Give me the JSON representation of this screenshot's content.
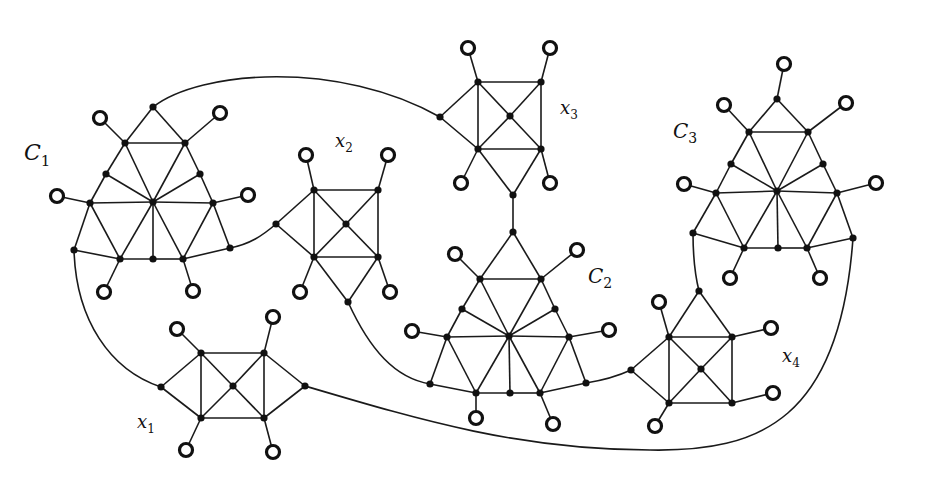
{
  "figure": {
    "colors": {
      "stroke": "#1a1a1a",
      "node": "#111111",
      "ring_fill": "#ffffff",
      "background": "#ffffff"
    }
  },
  "labels": [
    {
      "id": "C1",
      "main": "C",
      "sub": "1",
      "x": 24,
      "y": 160,
      "size": 22
    },
    {
      "id": "C2",
      "main": "C",
      "sub": "2",
      "x": 588,
      "y": 283,
      "size": 20
    },
    {
      "id": "C3",
      "main": "C",
      "sub": "3",
      "x": 673,
      "y": 138,
      "size": 20
    },
    {
      "id": "x1",
      "main": "x",
      "sub": "1",
      "x": 137,
      "y": 428,
      "size": 18
    },
    {
      "id": "x2",
      "main": "x",
      "sub": "2",
      "x": 335,
      "y": 147,
      "size": 18
    },
    {
      "id": "x3",
      "main": "x",
      "sub": "3",
      "x": 560,
      "y": 114,
      "size": 18
    },
    {
      "id": "x4",
      "main": "x",
      "sub": "4",
      "x": 782,
      "y": 362,
      "size": 18
    }
  ],
  "nodes": {
    "c1_top": [
      153,
      107
    ],
    "c1_ul": [
      125,
      143
    ],
    "c1_ur": [
      185,
      143
    ],
    "c1_ml": [
      106,
      174
    ],
    "c1_mr": [
      200,
      174
    ],
    "c1_l": [
      90,
      203
    ],
    "c1_c": [
      153,
      202
    ],
    "c1_r": [
      213,
      203
    ],
    "c1_bl": [
      74,
      250
    ],
    "c1_b1": [
      120,
      259
    ],
    "c1_b2": [
      153,
      259
    ],
    "c1_b3": [
      183,
      259
    ],
    "c1_br": [
      230,
      248
    ],
    "x2_tl": [
      314,
      190
    ],
    "x2_tr": [
      378,
      190
    ],
    "x2_c": [
      346,
      224
    ],
    "x2_bl": [
      314,
      257
    ],
    "x2_br": [
      378,
      257
    ],
    "x2_l": [
      276,
      224
    ],
    "x2_b": [
      348,
      302
    ],
    "x3_tl": [
      478,
      82
    ],
    "x3_tr": [
      541,
      82
    ],
    "x3_c": [
      510,
      116
    ],
    "x3_bl": [
      478,
      149
    ],
    "x3_br": [
      541,
      149
    ],
    "x3_l": [
      440,
      117
    ],
    "x3_b": [
      513,
      195
    ],
    "c2_top": [
      513,
      232
    ],
    "c2_ul": [
      480,
      279
    ],
    "c2_ur": [
      541,
      279
    ],
    "c2_ml": [
      462,
      309
    ],
    "c2_mr": [
      555,
      309
    ],
    "c2_l": [
      447,
      337
    ],
    "c2_c": [
      509,
      336
    ],
    "c2_r": [
      569,
      337
    ],
    "c2_bl": [
      430,
      384
    ],
    "c2_b1": [
      476,
      393
    ],
    "c2_b2": [
      510,
      393
    ],
    "c2_b3": [
      540,
      393
    ],
    "c2_br": [
      586,
      383
    ],
    "c3_top": [
      777,
      99
    ],
    "c3_ul": [
      749,
      132
    ],
    "c3_ur": [
      808,
      132
    ],
    "c3_ml": [
      731,
      164
    ],
    "c3_mr": [
      823,
      164
    ],
    "c3_l": [
      716,
      193
    ],
    "c3_c": [
      777,
      191
    ],
    "c3_r": [
      837,
      193
    ],
    "c3_bl": [
      693,
      233
    ],
    "c3_b1": [
      744,
      248
    ],
    "c3_b2": [
      778,
      248
    ],
    "c3_b3": [
      807,
      248
    ],
    "c3_br": [
      853,
      238
    ],
    "x4_t": [
      699,
      291
    ],
    "x4_tl": [
      669,
      337
    ],
    "x4_tr": [
      732,
      337
    ],
    "x4_c": [
      701,
      369
    ],
    "x4_bl": [
      669,
      403
    ],
    "x4_br": [
      732,
      403
    ],
    "x4_l": [
      631,
      370
    ],
    "x1_tl": [
      201,
      353
    ],
    "x1_tr": [
      264,
      353
    ],
    "x1_c": [
      233,
      386
    ],
    "x1_bl": [
      201,
      418
    ],
    "x1_br": [
      264,
      418
    ],
    "x1_l": [
      161,
      387
    ],
    "x1_r": [
      305,
      386
    ]
  },
  "rings": [
    {
      "at": [
        100,
        118
      ],
      "to": "c1_ul"
    },
    {
      "at": [
        220,
        113
      ],
      "to": "c1_ur"
    },
    {
      "at": [
        57,
        196
      ],
      "to": "c1_l"
    },
    {
      "at": [
        248,
        195
      ],
      "to": "c1_r"
    },
    {
      "at": [
        104,
        292
      ],
      "to": "c1_b1"
    },
    {
      "at": [
        193,
        291
      ],
      "to": "c1_b3"
    },
    {
      "at": [
        306,
        155
      ],
      "to": "x2_tl"
    },
    {
      "at": [
        388,
        155
      ],
      "to": "x2_tr"
    },
    {
      "at": [
        300,
        292
      ],
      "to": "x2_bl"
    },
    {
      "at": [
        390,
        292
      ],
      "to": "x2_br"
    },
    {
      "at": [
        468,
        48
      ],
      "to": "x3_tl"
    },
    {
      "at": [
        550,
        48
      ],
      "to": "x3_tr"
    },
    {
      "at": [
        461,
        183
      ],
      "to": "x3_bl"
    },
    {
      "at": [
        550,
        183
      ],
      "to": "x3_br"
    },
    {
      "at": [
        455,
        254
      ],
      "to": "c2_ul"
    },
    {
      "at": [
        577,
        250
      ],
      "to": "c2_ur"
    },
    {
      "at": [
        412,
        331
      ],
      "to": "c2_l"
    },
    {
      "at": [
        609,
        330
      ],
      "to": "c2_r"
    },
    {
      "at": [
        476,
        418
      ],
      "to": "c2_b1"
    },
    {
      "at": [
        553,
        424
      ],
      "to": "c2_b3"
    },
    {
      "at": [
        784,
        64
      ],
      "to": "c3_top"
    },
    {
      "at": [
        724,
        105
      ],
      "to": "c3_ul"
    },
    {
      "at": [
        846,
        103
      ],
      "to": "c3_ur"
    },
    {
      "at": [
        684,
        184
      ],
      "to": "c3_l"
    },
    {
      "at": [
        876,
        183
      ],
      "to": "c3_r"
    },
    {
      "at": [
        730,
        278
      ],
      "to": "c3_b1"
    },
    {
      "at": [
        820,
        278
      ],
      "to": "c3_b3"
    },
    {
      "at": [
        659,
        302
      ],
      "to": "x4_tl"
    },
    {
      "at": [
        771,
        328
      ],
      "to": "x4_tr"
    },
    {
      "at": [
        773,
        393
      ],
      "to": "x4_br"
    },
    {
      "at": [
        655,
        426
      ],
      "to": "x4_bl"
    },
    {
      "at": [
        177,
        329
      ],
      "to": "x1_tl"
    },
    {
      "at": [
        273,
        317
      ],
      "to": "x1_tr"
    },
    {
      "at": [
        186,
        450
      ],
      "to": "x1_bl"
    },
    {
      "at": [
        273,
        452
      ],
      "to": "x1_br"
    }
  ],
  "edges": [
    [
      "c1_top",
      "c1_ul"
    ],
    [
      "c1_top",
      "c1_ur"
    ],
    [
      "c1_ul",
      "c1_ur"
    ],
    [
      "c1_ul",
      "c1_ml"
    ],
    [
      "c1_ml",
      "c1_l"
    ],
    [
      "c1_ur",
      "c1_mr"
    ],
    [
      "c1_mr",
      "c1_r"
    ],
    [
      "c1_ul",
      "c1_c"
    ],
    [
      "c1_ur",
      "c1_c"
    ],
    [
      "c1_ml",
      "c1_c"
    ],
    [
      "c1_mr",
      "c1_c"
    ],
    [
      "c1_l",
      "c1_c"
    ],
    [
      "c1_c",
      "c1_r"
    ],
    [
      "c1_l",
      "c1_bl"
    ],
    [
      "c1_l",
      "c1_b1"
    ],
    [
      "c1_c",
      "c1_b1"
    ],
    [
      "c1_c",
      "c1_b2"
    ],
    [
      "c1_c",
      "c1_b3"
    ],
    [
      "c1_r",
      "c1_b3"
    ],
    [
      "c1_r",
      "c1_br"
    ],
    [
      "c1_bl",
      "c1_b1"
    ],
    [
      "c1_b1",
      "c1_b2"
    ],
    [
      "c1_b2",
      "c1_b3"
    ],
    [
      "c1_b3",
      "c1_br"
    ],
    [
      "x2_tl",
      "x2_tr"
    ],
    [
      "x2_bl",
      "x2_br"
    ],
    [
      "x2_tl",
      "x2_bl"
    ],
    [
      "x2_tr",
      "x2_br"
    ],
    [
      "x2_tl",
      "x2_c"
    ],
    [
      "x2_tr",
      "x2_c"
    ],
    [
      "x2_bl",
      "x2_c"
    ],
    [
      "x2_br",
      "x2_c"
    ],
    [
      "x2_l",
      "x2_tl"
    ],
    [
      "x2_l",
      "x2_bl"
    ],
    [
      "x2_bl",
      "x2_b"
    ],
    [
      "x2_br",
      "x2_b"
    ],
    [
      "x3_tl",
      "x3_tr"
    ],
    [
      "x3_bl",
      "x3_br"
    ],
    [
      "x3_tl",
      "x3_bl"
    ],
    [
      "x3_tr",
      "x3_br"
    ],
    [
      "x3_tl",
      "x3_c"
    ],
    [
      "x3_tr",
      "x3_c"
    ],
    [
      "x3_bl",
      "x3_c"
    ],
    [
      "x3_br",
      "x3_c"
    ],
    [
      "x3_l",
      "x3_tl"
    ],
    [
      "x3_l",
      "x3_bl"
    ],
    [
      "x3_bl",
      "x3_b"
    ],
    [
      "x3_br",
      "x3_b"
    ],
    [
      "x3_b",
      "c2_top"
    ],
    [
      "c2_top",
      "c2_ul"
    ],
    [
      "c2_top",
      "c2_ur"
    ],
    [
      "c2_ul",
      "c2_ur"
    ],
    [
      "c2_ul",
      "c2_ml"
    ],
    [
      "c2_ml",
      "c2_l"
    ],
    [
      "c2_ur",
      "c2_mr"
    ],
    [
      "c2_mr",
      "c2_r"
    ],
    [
      "c2_ul",
      "c2_c"
    ],
    [
      "c2_ur",
      "c2_c"
    ],
    [
      "c2_ml",
      "c2_c"
    ],
    [
      "c2_mr",
      "c2_c"
    ],
    [
      "c2_l",
      "c2_c"
    ],
    [
      "c2_c",
      "c2_r"
    ],
    [
      "c2_l",
      "c2_bl"
    ],
    [
      "c2_l",
      "c2_b1"
    ],
    [
      "c2_c",
      "c2_b1"
    ],
    [
      "c2_c",
      "c2_b2"
    ],
    [
      "c2_c",
      "c2_b3"
    ],
    [
      "c2_r",
      "c2_b3"
    ],
    [
      "c2_r",
      "c2_br"
    ],
    [
      "c2_bl",
      "c2_b1"
    ],
    [
      "c2_b1",
      "c2_b2"
    ],
    [
      "c2_b2",
      "c2_b3"
    ],
    [
      "c2_b3",
      "c2_br"
    ],
    [
      "c3_top",
      "c3_ul"
    ],
    [
      "c3_top",
      "c3_ur"
    ],
    [
      "c3_ul",
      "c3_ur"
    ],
    [
      "c3_ul",
      "c3_ml"
    ],
    [
      "c3_ml",
      "c3_l"
    ],
    [
      "c3_ur",
      "c3_mr"
    ],
    [
      "c3_mr",
      "c3_r"
    ],
    [
      "c3_ul",
      "c3_c"
    ],
    [
      "c3_ur",
      "c3_c"
    ],
    [
      "c3_ml",
      "c3_c"
    ],
    [
      "c3_mr",
      "c3_c"
    ],
    [
      "c3_l",
      "c3_c"
    ],
    [
      "c3_c",
      "c3_r"
    ],
    [
      "c3_l",
      "c3_bl"
    ],
    [
      "c3_l",
      "c3_b1"
    ],
    [
      "c3_c",
      "c3_b1"
    ],
    [
      "c3_c",
      "c3_b2"
    ],
    [
      "c3_c",
      "c3_b3"
    ],
    [
      "c3_r",
      "c3_b3"
    ],
    [
      "c3_r",
      "c3_br"
    ],
    [
      "c3_bl",
      "c3_b1"
    ],
    [
      "c3_b1",
      "c3_b2"
    ],
    [
      "c3_b2",
      "c3_b3"
    ],
    [
      "c3_b3",
      "c3_br"
    ],
    [
      "x4_tl",
      "x4_tr"
    ],
    [
      "x4_bl",
      "x4_br"
    ],
    [
      "x4_tl",
      "x4_bl"
    ],
    [
      "x4_tr",
      "x4_br"
    ],
    [
      "x4_tl",
      "x4_c"
    ],
    [
      "x4_tr",
      "x4_c"
    ],
    [
      "x4_bl",
      "x4_c"
    ],
    [
      "x4_br",
      "x4_c"
    ],
    [
      "x4_l",
      "x4_tl"
    ],
    [
      "x4_l",
      "x4_bl"
    ],
    [
      "x4_t",
      "x4_tl"
    ],
    [
      "x4_t",
      "x4_tr"
    ],
    [
      "x1_tl",
      "x1_tr"
    ],
    [
      "x1_bl",
      "x1_br"
    ],
    [
      "x1_tl",
      "x1_bl"
    ],
    [
      "x1_tr",
      "x1_br"
    ],
    [
      "x1_tl",
      "x1_c"
    ],
    [
      "x1_tr",
      "x1_c"
    ],
    [
      "x1_bl",
      "x1_c"
    ],
    [
      "x1_br",
      "x1_c"
    ],
    [
      "x1_l",
      "x1_tl"
    ],
    [
      "x1_l",
      "x1_bl"
    ],
    [
      "x1_r",
      "x1_tr"
    ],
    [
      "x1_r",
      "x1_br"
    ]
  ],
  "curves": [
    {
      "id": "c1top-x3l",
      "d": "M153,107 C200,70 340,60 440,117"
    },
    {
      "id": "c1br-x2l",
      "d": "M230,248 C250,244 262,236 276,224"
    },
    {
      "id": "c1bl-x1l",
      "d": "M74,250 C76,320 110,370 161,387"
    },
    {
      "id": "x2b-c2bl",
      "d": "M348,302 C370,350 395,378 430,384"
    },
    {
      "id": "c2br-x4l",
      "d": "M586,383 C605,380 618,376 631,370"
    },
    {
      "id": "x1r-x4bottom",
      "d": "M305,386 C420,420 520,450 650,450 C760,452 840,420 853,238"
    },
    {
      "id": "c3bl-x4t",
      "d": "M693,233 C693,255 695,275 699,291"
    }
  ]
}
